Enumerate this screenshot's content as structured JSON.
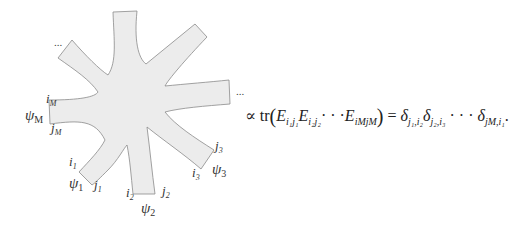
{
  "diagram": {
    "type": "star-graph",
    "fill_color": "#ececec",
    "edge_color": "#888888",
    "arms": 8,
    "labels": {
      "iM": {
        "base": "i",
        "sub": "M"
      },
      "psiM": {
        "base": "ψ",
        "sub": "M"
      },
      "jM": {
        "base": "j",
        "sub": "M"
      },
      "i1": {
        "base": "i",
        "sub": "1"
      },
      "psi1": {
        "base": "ψ",
        "sub": "1"
      },
      "j1": {
        "base": "j",
        "sub": "1"
      },
      "i2": {
        "base": "i",
        "sub": "2"
      },
      "psi2": {
        "base": "ψ",
        "sub": "2"
      },
      "j2": {
        "base": "j",
        "sub": "2"
      },
      "i3": {
        "base": "i",
        "sub": "3"
      },
      "psi3": {
        "base": "ψ",
        "sub": "3"
      },
      "j3": {
        "base": "j",
        "sub": "3"
      }
    },
    "ellipsis_left": "...",
    "ellipsis_right": "..."
  },
  "equation": {
    "prop": "∝",
    "tr": "tr",
    "lparen": "(",
    "rparen": ")",
    "E": "E",
    "t1_sub": "i₁j₁",
    "t2_sub": "i₂j₂",
    "mid_dots": "· · ·",
    "tM_sub": "iMjM",
    "equals": "=",
    "delta": "δ",
    "d1_sub": "j₁,i₂",
    "d2_sub": "j₂,i₃",
    "dM_sub": "jM,i₁",
    "end": "."
  }
}
